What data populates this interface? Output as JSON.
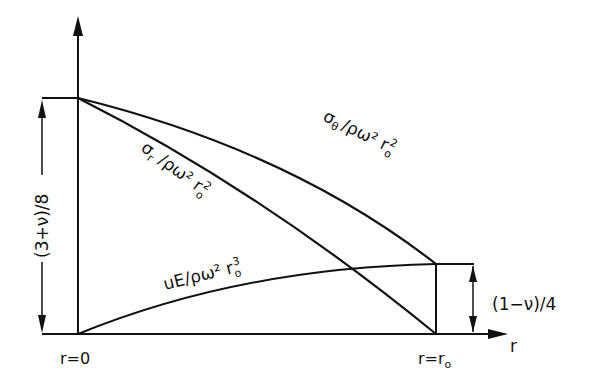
{
  "diagram": {
    "axes": {
      "x_label": "r",
      "x_start_label": "r=0",
      "x_end_label": "r=r",
      "x_end_subscript": "o"
    },
    "curves": [
      {
        "id": "sigma_theta",
        "label": "σ",
        "label_sub": "θ",
        "label_rest": "/ρω² r",
        "label_rest_sub": "o",
        "label_rest_sup": "2",
        "start_value": "(3+ν)/8",
        "end_value": "(1−ν)/4"
      },
      {
        "id": "sigma_r",
        "label": "σ",
        "label_sub": "r",
        "label_rest": "/ρω² r",
        "label_rest_sub": "o",
        "label_rest_sup": "2",
        "start_value": "(3+ν)/8",
        "end_value": "0"
      },
      {
        "id": "displacement",
        "label": "uE/ρω² r",
        "label_sub": "o",
        "label_sup": "3",
        "start_value": "0",
        "end_value": "(1−ν)/4"
      }
    ],
    "dimensions": {
      "left": "(3+ν)/8",
      "right": "(1−ν)/4"
    },
    "colors": {
      "ink": "#111111",
      "background": "#ffffff"
    }
  }
}
